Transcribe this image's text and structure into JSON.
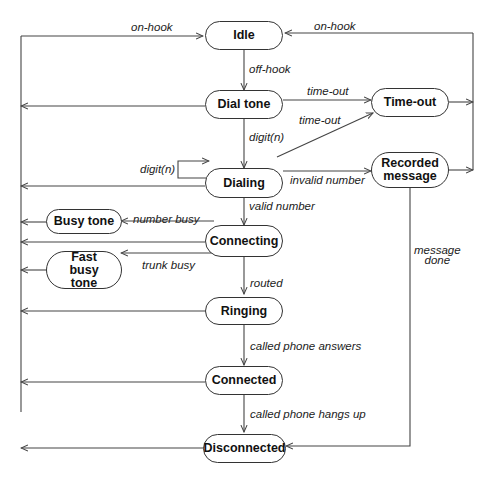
{
  "diagram": {
    "type": "state-machine",
    "states": {
      "idle": "Idle",
      "dial_tone": "Dial tone",
      "time_out": "Time-out",
      "dialing": "Dialing",
      "recorded_message": "Recorded message",
      "busy_tone": "Busy tone",
      "connecting": "Connecting",
      "fast_busy_tone": "Fast busy tone",
      "ringing": "Ringing",
      "connected": "Connected",
      "disconnected": "Disconnected"
    },
    "transitions": {
      "on_hook_left": "on-hook",
      "on_hook_right": "on-hook",
      "off_hook": "off-hook",
      "dialtone_timeout": "time-out",
      "dialing_timeout": "time-out",
      "digit_n_down": "digit(n)",
      "digit_n_self": "digit(n)",
      "invalid_number": "invalid number",
      "valid_number": "valid number",
      "number_busy": "number busy",
      "trunk_busy": "trunk busy",
      "routed": "routed",
      "message_done": "message\ndone",
      "called_phone_answers": "called phone answers",
      "called_phone_hangs_up": "called phone hangs up"
    },
    "edges": [
      {
        "from": "Idle",
        "to": "Dial tone",
        "label": "off-hook"
      },
      {
        "from": "Dial tone",
        "to": "Dialing",
        "label": "digit(n)"
      },
      {
        "from": "Dial tone",
        "to": "Time-out",
        "label": "time-out"
      },
      {
        "from": "Dialing",
        "to": "Time-out",
        "label": "time-out"
      },
      {
        "from": "Dialing",
        "to": "Dialing",
        "label": "digit(n)"
      },
      {
        "from": "Dialing",
        "to": "Recorded message",
        "label": "invalid number"
      },
      {
        "from": "Dialing",
        "to": "Connecting",
        "label": "valid number"
      },
      {
        "from": "Connecting",
        "to": "Busy tone",
        "label": "number busy"
      },
      {
        "from": "Connecting",
        "to": "Fast busy tone",
        "label": "trunk busy"
      },
      {
        "from": "Connecting",
        "to": "Ringing",
        "label": "routed"
      },
      {
        "from": "Ringing",
        "to": "Connected",
        "label": "called phone answers"
      },
      {
        "from": "Connected",
        "to": "Disconnected",
        "label": "called phone hangs up"
      },
      {
        "from": "Recorded message",
        "to": "Disconnected",
        "label": "message done"
      },
      {
        "from": "Time-out / Recorded message",
        "to": "Idle",
        "label": "on-hook"
      },
      {
        "from": "All left-side states",
        "to": "Idle",
        "label": "on-hook"
      }
    ]
  }
}
